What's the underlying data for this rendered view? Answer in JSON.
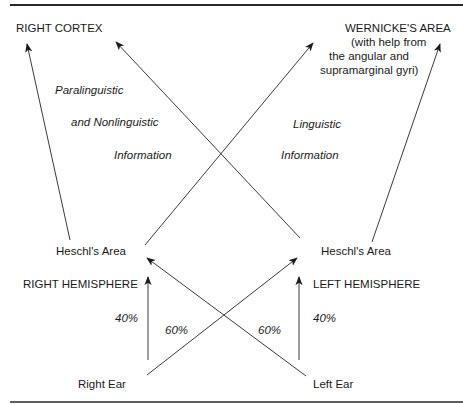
{
  "diagram": {
    "targets": {
      "right_cortex": "RIGHT CORTEX",
      "wernicke_title": "WERNICKE'S AREA",
      "wernicke_note_1": "(with help from",
      "wernicke_note_2": "the angular and",
      "wernicke_note_3": "supramarginal gyri)"
    },
    "info_labels": {
      "right_line_1": "Paralinguistic",
      "right_line_2": "and Nonlinguistic",
      "right_line_3": "Information",
      "left_line_1": "Linguistic",
      "left_line_2": "Information"
    },
    "nodes": {
      "heschl_right": "Heschl's Area",
      "heschl_left": "Heschl's Area",
      "right_hemisphere": "RIGHT HEMISPHERE",
      "left_hemisphere": "LEFT HEMISPHERE",
      "right_ear": "Right Ear",
      "left_ear": "Left Ear"
    },
    "percentages": {
      "right_ipsilateral": "40%",
      "right_contralateral": "60%",
      "left_contralateral": "60%",
      "left_ipsilateral": "40%"
    },
    "colors": {
      "line": "#3a3a3a",
      "rule": "#2a2a2a",
      "text": "#1a1a1a"
    }
  }
}
